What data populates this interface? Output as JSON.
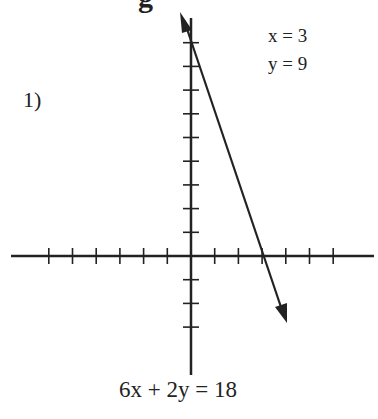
{
  "heading_partial": "g",
  "problem": {
    "number": "1)",
    "solution": {
      "x_line": "x = 3",
      "y_line": "y = 9"
    },
    "equation": "6x + 2y = 18"
  },
  "graph": {
    "x_ticks_each_side": 6,
    "y_ticks_up": 9,
    "y_ticks_down": 3,
    "tick_spacing_px": 23.7,
    "origin_px": [
      191,
      256
    ],
    "line_color": "#222222"
  },
  "chart_data": {
    "type": "line",
    "title": "",
    "equation": "6x + 2y = 18",
    "points": [
      {
        "x": 0,
        "y": 9
      },
      {
        "x": 3,
        "y": 0
      }
    ],
    "intercepts": {
      "x": 3,
      "y": 9
    },
    "xlim": [
      -7.6,
      7.8
    ],
    "ylim": [
      -5,
      10
    ],
    "grid": false,
    "arrows": "both ends"
  }
}
